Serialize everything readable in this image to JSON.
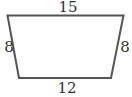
{
  "figure": {
    "shape": "trapezoid",
    "stroke_color": "#555555",
    "sides": {
      "top": "15",
      "left": "8",
      "right": "8",
      "bottom": "12"
    }
  }
}
